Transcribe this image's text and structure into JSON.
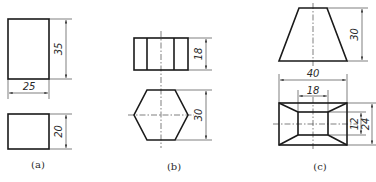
{
  "figures": [
    {
      "id": "a",
      "label": "(a)",
      "dimensions": {
        "front_height": "35",
        "width": "25",
        "top_height": "20"
      }
    },
    {
      "id": "b",
      "label": "(b)",
      "dimensions": {
        "front_height": "18",
        "hex_across_corners": "30"
      }
    },
    {
      "id": "c",
      "label": "(c)",
      "dimensions": {
        "front_height": "30",
        "outer_width": "40",
        "inner_width": "18",
        "inner_depth": "12",
        "outer_depth": "24"
      }
    }
  ]
}
